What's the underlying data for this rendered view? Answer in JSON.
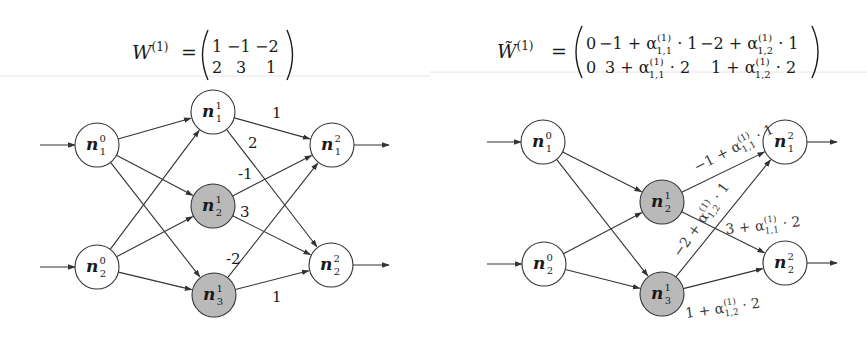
{
  "colors": {
    "node_fill_default": "#ffffff",
    "node_fill_highlight": "#b9b9b9",
    "stroke": "#333333",
    "text": "#1a1a1a"
  },
  "left_panel": {
    "formula": {
      "lhs": "W",
      "lhs_superscript": "(1)",
      "equals": "=",
      "matrix": [
        [
          "1",
          "−1",
          "−2"
        ],
        [
          "2",
          "3",
          "1"
        ]
      ]
    },
    "nodes": [
      {
        "id": "n1_0",
        "base": "n",
        "sub": "1",
        "sup": "0",
        "x": 97,
        "y": 145,
        "r": 22,
        "highlight": false
      },
      {
        "id": "n2_0",
        "base": "n",
        "sub": "2",
        "sup": "0",
        "x": 97,
        "y": 267,
        "r": 22,
        "highlight": false
      },
      {
        "id": "n1_1",
        "base": "n",
        "sub": "1",
        "sup": "1",
        "x": 213,
        "y": 112,
        "r": 22,
        "highlight": false
      },
      {
        "id": "n2_1",
        "base": "n",
        "sub": "2",
        "sup": "1",
        "x": 213,
        "y": 206,
        "r": 22,
        "highlight": true
      },
      {
        "id": "n3_1",
        "base": "n",
        "sub": "3",
        "sup": "1",
        "x": 214,
        "y": 295,
        "r": 22,
        "highlight": true
      },
      {
        "id": "n1_2",
        "base": "n",
        "sub": "1",
        "sup": "2",
        "x": 332,
        "y": 145,
        "r": 22,
        "highlight": false
      },
      {
        "id": "n2_2",
        "base": "n",
        "sub": "2",
        "sup": "2",
        "x": 331,
        "y": 265,
        "r": 22,
        "highlight": false
      }
    ],
    "edges": [
      {
        "from": "n1_0",
        "to": "n1_1"
      },
      {
        "from": "n1_0",
        "to": "n2_1"
      },
      {
        "from": "n1_0",
        "to": "n3_1"
      },
      {
        "from": "n2_0",
        "to": "n1_1"
      },
      {
        "from": "n2_0",
        "to": "n2_1"
      },
      {
        "from": "n2_0",
        "to": "n3_1"
      },
      {
        "from": "n1_1",
        "to": "n1_2",
        "label": "1",
        "lx": 272,
        "ly": 118
      },
      {
        "from": "n1_1",
        "to": "n2_2",
        "label": "2",
        "lx": 248,
        "ly": 148
      },
      {
        "from": "n2_1",
        "to": "n1_2",
        "label": "-1",
        "lx": 238,
        "ly": 179
      },
      {
        "from": "n2_1",
        "to": "n2_2",
        "label": "3",
        "lx": 240,
        "ly": 217
      },
      {
        "from": "n3_1",
        "to": "n1_2",
        "label": "-2",
        "lx": 226,
        "ly": 264
      },
      {
        "from": "n3_1",
        "to": "n2_2",
        "label": "1",
        "lx": 272,
        "ly": 302
      }
    ],
    "inputs": [
      {
        "node": "n1_0",
        "x1": 40,
        "x2": 75
      },
      {
        "node": "n2_0",
        "x1": 40,
        "x2": 75
      }
    ],
    "outputs": [
      {
        "node": "n1_2",
        "x1": 354,
        "x2": 389
      },
      {
        "node": "n2_2",
        "x1": 353,
        "x2": 389
      }
    ]
  },
  "right_panel": {
    "formula": {
      "lhs": "W̃",
      "lhs_superscript": "(1)",
      "equals": "=",
      "matrix": [
        [
          "0",
          "−1 + α(1)1,1 · 1",
          "−2 + α(1)1,2 · 1"
        ],
        [
          "0",
          "3 + α(1)1,1 · 2",
          "1 + α(1)1,2 · 2"
        ]
      ]
    },
    "nodes": [
      {
        "id": "m1_0",
        "base": "n",
        "sub": "1",
        "sup": "0",
        "x": 543,
        "y": 142,
        "r": 22,
        "highlight": false
      },
      {
        "id": "m2_0",
        "base": "n",
        "sub": "2",
        "sup": "0",
        "x": 544,
        "y": 264,
        "r": 22,
        "highlight": false
      },
      {
        "id": "m2_1",
        "base": "n",
        "sub": "2",
        "sup": "1",
        "x": 662,
        "y": 202,
        "r": 22,
        "highlight": true
      },
      {
        "id": "m3_1",
        "base": "n",
        "sub": "3",
        "sup": "1",
        "x": 662,
        "y": 294,
        "r": 22,
        "highlight": true
      },
      {
        "id": "m1_2",
        "base": "n",
        "sub": "1",
        "sup": "2",
        "x": 785,
        "y": 142,
        "r": 22,
        "highlight": false
      },
      {
        "id": "m2_2",
        "base": "n",
        "sub": "2",
        "sup": "2",
        "x": 785,
        "y": 263,
        "r": 22,
        "highlight": false
      }
    ],
    "edges": [
      {
        "from": "m1_0",
        "to": "m2_1"
      },
      {
        "from": "m1_0",
        "to": "m3_1"
      },
      {
        "from": "m2_0",
        "to": "m2_1"
      },
      {
        "from": "m2_0",
        "to": "m3_1"
      },
      {
        "from": "m2_1",
        "to": "m1_2",
        "label": {
          "pre": "−1 + α",
          "sup": "(1)",
          "sub": "1,1",
          "post": " · 1"
        },
        "lx": 697,
        "ly": 172,
        "angle": -27
      },
      {
        "from": "m3_1",
        "to": "m1_2",
        "label": {
          "pre": "−2 + α",
          "sup": "(1)",
          "sub": "1,2",
          "post": " · 1"
        },
        "lx": 680,
        "ly": 258,
        "angle": -55
      },
      {
        "from": "m2_1",
        "to": "m2_2",
        "label": {
          "pre": "3 + α",
          "sup": "(1)",
          "sub": "1,1",
          "post": " · 2"
        },
        "lx": 726,
        "ly": 234,
        "angle": -6
      },
      {
        "from": "m3_1",
        "to": "m2_2",
        "label": {
          "pre": "1 + α",
          "sup": "(1)",
          "sub": "1,2",
          "post": " · 2"
        },
        "lx": 686,
        "ly": 318,
        "angle": -8
      }
    ],
    "inputs": [
      {
        "node": "m1_0",
        "x1": 487,
        "x2": 521
      },
      {
        "node": "m2_0",
        "x1": 487,
        "x2": 522
      }
    ],
    "outputs": [
      {
        "node": "m1_2",
        "x1": 807,
        "x2": 837
      },
      {
        "node": "m2_2",
        "x1": 807,
        "x2": 837
      }
    ]
  }
}
